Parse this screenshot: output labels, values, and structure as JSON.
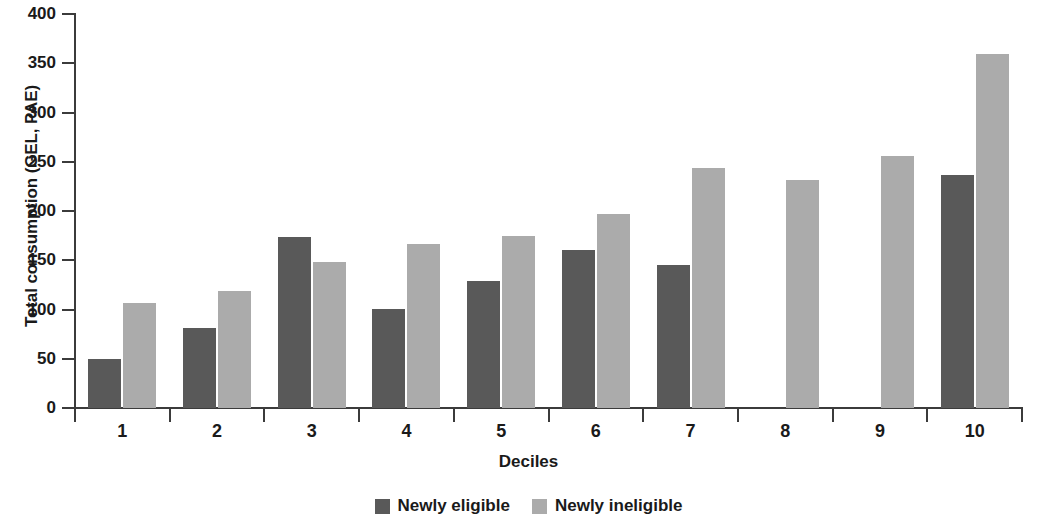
{
  "chart_data": {
    "type": "bar",
    "title": "",
    "subtitle": "",
    "xlabel": "Deciles",
    "ylabel": "Total consumption (GEL, PAE)",
    "categories": [
      "1",
      "2",
      "3",
      "4",
      "5",
      "6",
      "7",
      "8",
      "9",
      "10"
    ],
    "series": [
      {
        "name": "Newly eligible",
        "color": "#595959",
        "values": [
          50,
          81,
          174,
          101,
          129,
          160,
          145,
          0,
          0,
          237
        ]
      },
      {
        "name": "Newly ineligible",
        "color": "#ababab",
        "values": [
          107,
          119,
          148,
          167,
          175,
          197,
          244,
          231,
          256,
          359
        ]
      }
    ],
    "ylim": [
      0,
      400
    ],
    "ytick_step": 50,
    "yticks": [
      "0",
      "50",
      "100",
      "150",
      "200",
      "250",
      "300",
      "350",
      "400"
    ],
    "grid": false,
    "legend_position": "bottom",
    "grouped": true
  },
  "axes": {
    "y_title": "Total consumption (GEL, PAE)",
    "x_title": "Deciles",
    "axis_color": "#3b3b3b"
  },
  "legend": {
    "items": [
      {
        "label": "Newly eligible",
        "color": "#595959"
      },
      {
        "label": "Newly ineligible",
        "color": "#ababab"
      }
    ]
  }
}
